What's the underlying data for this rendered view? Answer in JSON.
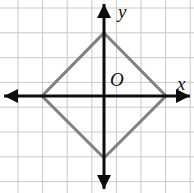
{
  "figure": {
    "width": 194,
    "height": 193,
    "background_color": "#ffffff"
  },
  "grid": {
    "color": "#c9c9c9",
    "line_width": 1,
    "spacing_px": 24.6,
    "vertical_lines_x": [
      18,
      42.6,
      67.2,
      91.8,
      116.4,
      141,
      165.6,
      190.2
    ],
    "horizontal_lines_y": [
      8,
      32.8,
      57.6,
      82.4,
      107.2,
      132,
      156.8,
      181.6
    ],
    "visible": true
  },
  "axes": {
    "color": "#0d0d0d",
    "line_width": 3,
    "origin": {
      "x": 104,
      "y": 96
    },
    "x_axis": {
      "from_x": 4,
      "to_x": 190,
      "y": 96,
      "arrows": "both"
    },
    "y_axis": {
      "x": 104,
      "from_y": 4,
      "to_y": 189,
      "arrows": "both"
    },
    "arrow_half_width": 7,
    "arrow_length": 14
  },
  "labels": {
    "y_axis_label": "y",
    "x_axis_label": "x",
    "origin_label": "O"
  },
  "shape": {
    "name": "rhombus",
    "stroke_color": "#808080",
    "stroke_width": 3,
    "fill": "none",
    "vertices": [
      {
        "name": "top",
        "x": 104,
        "y": 33
      },
      {
        "name": "right",
        "x": 166,
        "y": 96
      },
      {
        "name": "bottom",
        "x": 104,
        "y": 158
      },
      {
        "name": "left",
        "x": 42,
        "y": 96
      }
    ],
    "points_attr": "104,33 166,96 104,158 42,96"
  },
  "chart_data": {
    "type": "scatter",
    "title": "",
    "xlabel": "x",
    "ylabel": "y",
    "grid": true,
    "legend": "none",
    "annotations": [
      "O"
    ],
    "series": [
      {
        "name": "rhombus",
        "closed": true,
        "x": [
          0,
          2.5,
          0,
          -2.5
        ],
        "y": [
          2.5,
          0,
          -2.5,
          0
        ]
      }
    ]
  }
}
